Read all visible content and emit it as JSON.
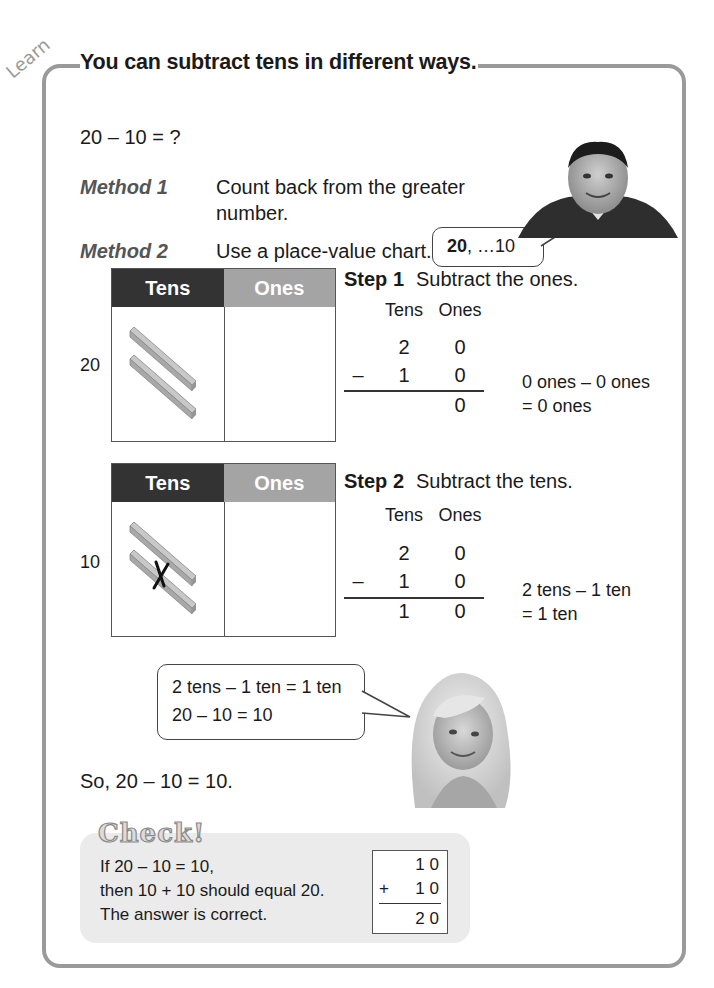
{
  "section_tag": "Learn",
  "title": "You can subtract tens in different ways.",
  "problem": "20 – 10 = ?",
  "methods": [
    {
      "label": "Method 1",
      "text_line1": "Count back from the greater",
      "text_line2": "number."
    },
    {
      "label": "Method 2",
      "text": "Use a place-value chart."
    }
  ],
  "boy_bubble": {
    "bold": "20",
    "rest": ", …10"
  },
  "charts": [
    {
      "number_label": "20",
      "headers": {
        "tens": "Tens",
        "ones": "Ones"
      },
      "tens_rods": 2,
      "crossed_rods": 0
    },
    {
      "number_label": "10",
      "headers": {
        "tens": "Tens",
        "ones": "Ones"
      },
      "tens_rods": 2,
      "crossed_rods": 1
    }
  ],
  "steps": [
    {
      "label": "Step 1",
      "text": "Subtract the ones.",
      "col_headers": {
        "tens": "Tens",
        "ones": "Ones"
      },
      "top": {
        "tens": "2",
        "ones": "0"
      },
      "operator": "–",
      "bottom": {
        "tens": "1",
        "ones": "0"
      },
      "result": {
        "tens": "",
        "ones": "0"
      },
      "note_line1": "0 ones – 0 ones",
      "note_line2": "= 0 ones"
    },
    {
      "label": "Step 2",
      "text": "Subtract the tens.",
      "col_headers": {
        "tens": "Tens",
        "ones": "Ones"
      },
      "top": {
        "tens": "2",
        "ones": "0"
      },
      "operator": "–",
      "bottom": {
        "tens": "1",
        "ones": "0"
      },
      "result": {
        "tens": "1",
        "ones": "0"
      },
      "note_line1": "2 tens – 1 ten",
      "note_line2": "= 1 ten"
    }
  ],
  "girl_bubble": {
    "line1": "2 tens – 1 ten = 1 ten",
    "line2": "20 – 10 = 10"
  },
  "conclusion": "So, 20 – 10 = 10.",
  "check": {
    "title": "Check!",
    "line1": "If 20 – 10 = 10,",
    "line2": "then 10 + 10 should equal 20.",
    "line3": "The answer is correct.",
    "sum": {
      "top": "1 0",
      "operator": "+",
      "bottom": "1 0",
      "result": "2 0"
    }
  },
  "colors": {
    "frame": "#9a9a9a",
    "tens_header": "#333333",
    "ones_header": "#a4a4a4",
    "check_bg": "#ebebeb"
  }
}
